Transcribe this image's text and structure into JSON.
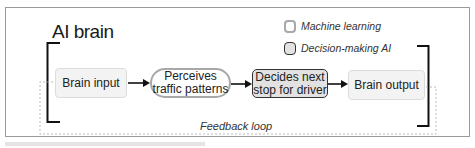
{
  "diagram": {
    "title": "AI brain",
    "legend": [
      {
        "label": "Machine learning",
        "style": "machine-learning"
      },
      {
        "label": "Decision-making AI",
        "style": "decision-making"
      }
    ],
    "nodes": [
      {
        "id": "brain-input",
        "label": "Brain input",
        "style": "plain"
      },
      {
        "id": "perceives",
        "label_line1": "Perceives",
        "label_line2": "traffic patterns",
        "style": "machine-learning"
      },
      {
        "id": "decides",
        "label_line1": "Decides next",
        "label_line2": "stop for driver",
        "style": "decision-making"
      },
      {
        "id": "brain-output",
        "label": "Brain output",
        "style": "plain"
      }
    ],
    "edges": [
      {
        "from": "brain-input",
        "to": "perceives"
      },
      {
        "from": "perceives",
        "to": "decides"
      },
      {
        "from": "decides",
        "to": "brain-output"
      },
      {
        "from": "brain-output",
        "to": "brain-input",
        "label": "Feedback loop",
        "style": "dashed"
      }
    ],
    "feedback_label": "Feedback loop",
    "colors": {
      "ml_border": "#a8a8a8",
      "dm_border": "#333333",
      "dm_fill": "#e2e2e2",
      "plain_fill": "#f3f3f3",
      "frame": "#9a9a9a"
    }
  }
}
